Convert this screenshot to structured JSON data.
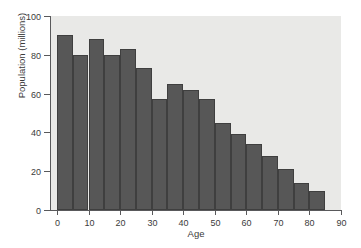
{
  "chart_data": {
    "type": "bar",
    "title": "",
    "subtitle": "",
    "xlabel": "Age",
    "ylabel": "Population (millions)",
    "xlim": [
      -2.2,
      90
    ],
    "ylim": [
      0,
      100
    ],
    "grid": false,
    "legend": null,
    "bar_color": "#575757",
    "bar_edge_color": "#3f3f3f",
    "plot_background": "#e9e9e7",
    "figure_background": "#ffffff",
    "axis_color": "#59595b",
    "bin_width": 5,
    "categories": [
      "0-5",
      "5-10",
      "10-15",
      "15-20",
      "20-25",
      "25-30",
      "30-35",
      "35-40",
      "40-45",
      "45-50",
      "50-55",
      "55-60",
      "60-65",
      "65-70",
      "70-75",
      "75-80",
      "80-85"
    ],
    "bin_starts": [
      0,
      5,
      10,
      15,
      20,
      25,
      30,
      35,
      40,
      45,
      50,
      55,
      60,
      65,
      70,
      75,
      80
    ],
    "values": [
      90,
      80,
      88,
      80,
      83,
      73,
      57,
      65,
      62,
      57,
      45,
      39,
      34,
      28,
      21,
      14,
      10
    ],
    "x_ticks": [
      0,
      10,
      20,
      30,
      40,
      50,
      60,
      70,
      80,
      90
    ],
    "x_tick_labels": [
      "0",
      "10",
      "20",
      "30",
      "40",
      "50",
      "60",
      "70",
      "80",
      "90"
    ],
    "y_ticks": [
      0,
      20,
      40,
      60,
      80,
      100
    ],
    "y_tick_labels": [
      "0",
      "20",
      "40",
      "60",
      "80",
      "100"
    ]
  }
}
